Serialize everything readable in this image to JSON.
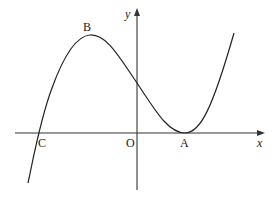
{
  "diagram": {
    "type": "function-graph",
    "axes": {
      "x_label": "x",
      "y_label": "y",
      "origin_label": "O"
    },
    "points": {
      "A": {
        "label": "A",
        "description": "curve touches x-axis (double root / local minimum)"
      },
      "B": {
        "label": "B",
        "description": "local maximum"
      },
      "C": {
        "label": "C",
        "description": "curve crosses x-axis (negative x)"
      }
    },
    "colors": {
      "stroke": "#222222",
      "background": "#ffffff"
    }
  }
}
